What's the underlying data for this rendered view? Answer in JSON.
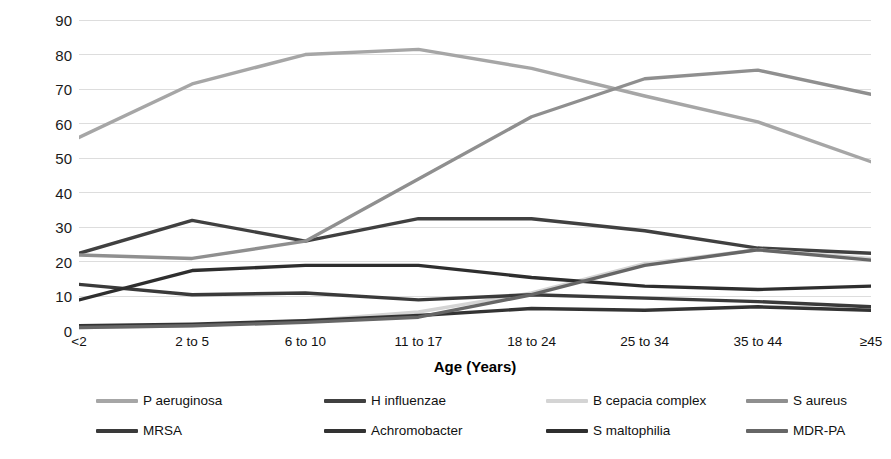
{
  "chart_data": {
    "type": "line",
    "title": "",
    "xlabel": "Age (Years)",
    "ylabel": "Percent of Patients",
    "categories": [
      "<2",
      "2 to 5",
      "6 to 10",
      "11 to 17",
      "18 to 24",
      "25 to 34",
      "35 to 44",
      "≥45"
    ],
    "ylim": [
      0,
      90
    ],
    "yticks": [
      0,
      10,
      20,
      30,
      40,
      50,
      60,
      70,
      80,
      90
    ],
    "grid": true,
    "legend_position": "bottom",
    "series": [
      {
        "name": "P aeruginosa",
        "color": "#a6a6a6",
        "values": [
          56,
          71.5,
          80,
          81.5,
          76,
          68,
          60.5,
          49
        ]
      },
      {
        "name": "H influenzae",
        "color": "#404040",
        "values": [
          22.5,
          32,
          26,
          32.5,
          32.5,
          29,
          24,
          22.5
        ]
      },
      {
        "name": "B cepacia complex",
        "color": "#d4d4d4",
        "values": [
          1,
          1.5,
          3,
          5.5,
          11,
          19.5,
          23.5,
          21
        ]
      },
      {
        "name": "S aureus",
        "color": "#8f8f8f",
        "values": [
          22,
          21,
          26,
          44,
          62,
          73,
          75.5,
          68.5
        ]
      },
      {
        "name": "MRSA",
        "color": "#3a3a3a",
        "values": [
          13.5,
          10.5,
          11,
          9,
          10.5,
          9.5,
          8.5,
          7
        ]
      },
      {
        "name": "Achromobacter",
        "color": "#333333",
        "values": [
          1.5,
          2,
          3,
          4.5,
          6.5,
          6,
          7,
          6
        ]
      },
      {
        "name": "S maltophilia",
        "color": "#2e2e2e",
        "values": [
          9,
          17.5,
          19,
          19,
          15.5,
          13,
          12,
          13
        ]
      },
      {
        "name": "MDR-PA",
        "color": "#666666",
        "values": [
          1,
          1.5,
          2.5,
          4,
          10.5,
          19,
          23.5,
          20.5
        ]
      }
    ]
  },
  "legend": {
    "rows": [
      [
        "P aeruginosa",
        "H influenzae",
        "B cepacia complex",
        "S aureus"
      ],
      [
        "MRSA",
        "Achromobacter",
        "S maltophilia",
        "MDR-PA"
      ]
    ]
  },
  "axis": {
    "x_title": "Age (Years)",
    "y_title": "Percent of Patients"
  }
}
